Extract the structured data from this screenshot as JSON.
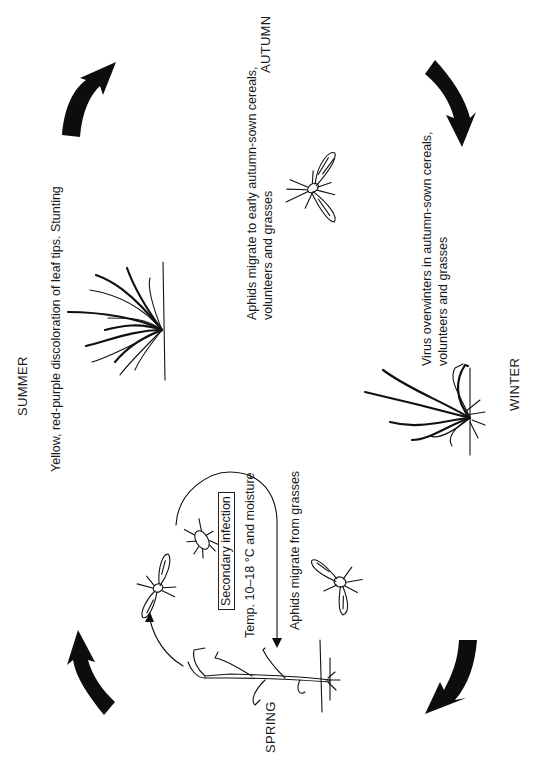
{
  "diagram": {
    "seasons": {
      "autumn": "AUTUMN",
      "winter": "WINTER",
      "spring": "SPRING",
      "summer": "SUMMER"
    },
    "captions": {
      "autumn_line1": "Aphids migrate to early autumn-sown cereals,",
      "autumn_line2": "volunteers and grasses",
      "winter_line1": "Virus overwinters in autumn-sown cereals,",
      "winter_line2": "volunteers and grasses",
      "summer": "Yellow, red-purple discoloration of leaf tips. Stunting",
      "secondary_infection": "Secondary infection",
      "temperature": "Temp. 10–18 °C and moisture",
      "spring_migration": "Aphids migrate from grasses"
    },
    "icons": [
      "cycle-arrow-icon",
      "winged-aphid-icon",
      "wingless-aphid-icon",
      "cereal-plant-icon"
    ],
    "colors": {
      "ink": "#111111",
      "background": "#ffffff"
    }
  }
}
